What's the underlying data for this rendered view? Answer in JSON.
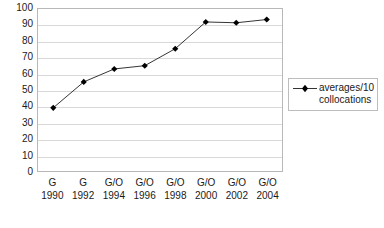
{
  "chart_data": {
    "type": "line",
    "title": "",
    "subtitle": "",
    "xlabel": "",
    "ylabel": "",
    "ylim": [
      0,
      100
    ],
    "y_ticks": [
      0,
      10,
      20,
      30,
      40,
      50,
      60,
      70,
      80,
      90,
      100
    ],
    "y_tick_labels": [
      "0",
      "10",
      "20",
      "30",
      "40",
      "50",
      "60",
      "70",
      "80",
      "90",
      "100"
    ],
    "grid": "horizontal",
    "legend_position": "right",
    "marker": "diamond",
    "marker_color": "#000000",
    "line_color": "#333333",
    "plot_border_color": "#b8b8b8",
    "gridline_color": "#d9d9d9",
    "categories": [
      "G\n1990",
      "G\n1992",
      "G/O\n1994",
      "G/O\n1996",
      "G/O\n1998",
      "G/O\n2000",
      "G/O\n2002",
      "G/O\n2004"
    ],
    "x_tick_categories": [
      "G",
      "G",
      "G/O",
      "G/O",
      "G/O",
      "G/O",
      "G/O",
      "G/O"
    ],
    "x_tick_years": [
      "1990",
      "1992",
      "1994",
      "1996",
      "1998",
      "2000",
      "2002",
      "2004"
    ],
    "series": [
      {
        "name": "averages/10 collocations",
        "values": [
          39,
          55,
          63,
          65,
          75.5,
          92,
          91.5,
          93.5
        ]
      }
    ],
    "legend": [
      {
        "label_line1": "averages/10",
        "label_line2": "collocations"
      }
    ]
  }
}
